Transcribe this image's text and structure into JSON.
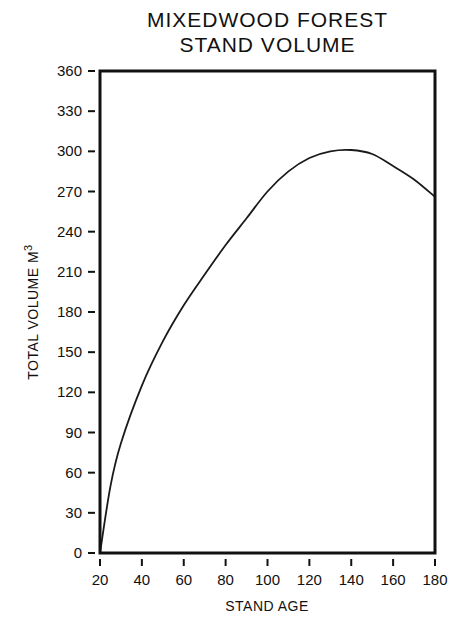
{
  "chart": {
    "title_line1": "MIXEDWOOD FOREST",
    "title_line2": "STAND VOLUME",
    "xlabel": "STAND AGE",
    "ylabel": "TOTAL VOLUME M",
    "ylabel_sup": "3"
  },
  "chart_data": {
    "type": "line",
    "xlabel": "STAND AGE",
    "ylabel": "TOTAL VOLUME M3",
    "xlim": [
      20,
      180
    ],
    "ylim": [
      0,
      360
    ],
    "x_ticks": [
      20,
      40,
      60,
      80,
      100,
      120,
      140,
      160,
      180
    ],
    "y_ticks": [
      0,
      30,
      60,
      90,
      120,
      150,
      180,
      210,
      240,
      270,
      300,
      330,
      360
    ],
    "grid": false,
    "legend": null,
    "series": [
      {
        "name": "Mixedwood stand volume",
        "x": [
          20,
          25,
          30,
          40,
          50,
          60,
          70,
          80,
          90,
          100,
          110,
          120,
          130,
          140,
          150,
          160,
          170,
          180
        ],
        "values": [
          0,
          50,
          82,
          125,
          158,
          185,
          208,
          230,
          250,
          270,
          285,
          295,
          300,
          301,
          298,
          289,
          279,
          266
        ]
      }
    ]
  }
}
